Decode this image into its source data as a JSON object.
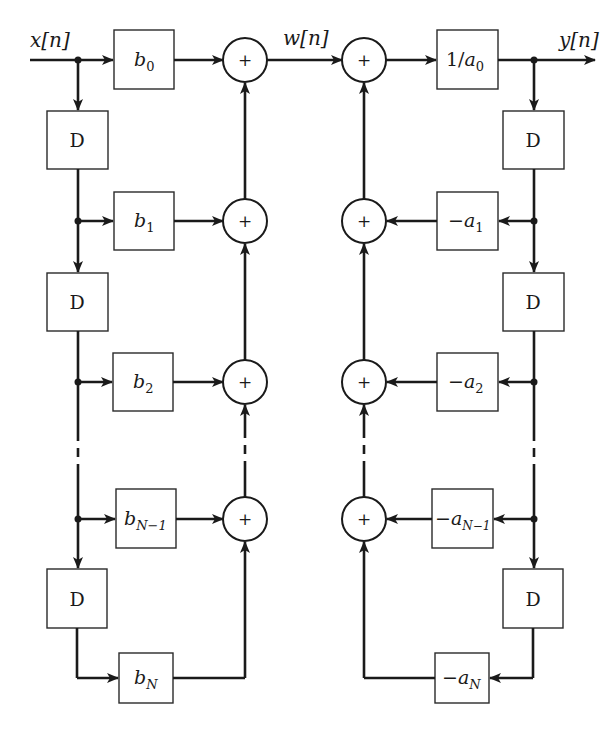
{
  "diagram": {
    "type": "block-diagram",
    "signals": {
      "input": "x[n]",
      "intermediate": "w[n]",
      "output": "y[n]"
    },
    "delay_label": "D",
    "adder_symbol": "+",
    "feedforward": {
      "coefficients": [
        {
          "base": "b",
          "sub": "0"
        },
        {
          "base": "b",
          "sub": "1"
        },
        {
          "base": "b",
          "sub": "2"
        },
        {
          "base": "b",
          "sub": "N−1"
        },
        {
          "base": "b",
          "sub": "N"
        }
      ]
    },
    "feedback": {
      "gain": {
        "prefix": "1/",
        "base": "a",
        "sub": "0"
      },
      "coefficients": [
        {
          "prefix": "−",
          "base": "a",
          "sub": "1"
        },
        {
          "prefix": "−",
          "base": "a",
          "sub": "2"
        },
        {
          "prefix": "−",
          "base": "a",
          "sub": "N−1"
        },
        {
          "prefix": "−",
          "base": "a",
          "sub": "N"
        }
      ]
    }
  }
}
